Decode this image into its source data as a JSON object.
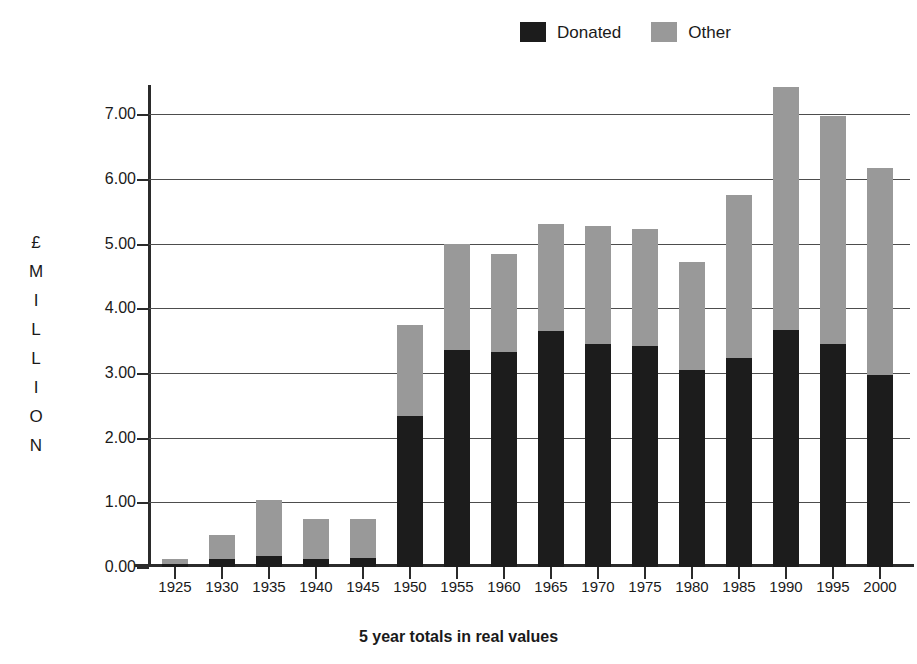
{
  "chart_data": {
    "type": "bar",
    "stacked": true,
    "title": "",
    "xlabel": "5 year totals in real values",
    "ylabel": "£ MILLION",
    "ylabel_letters": [
      "£",
      "M",
      "I",
      "L",
      "L",
      "I",
      "O",
      "N"
    ],
    "categories": [
      "1925",
      "1930",
      "1935",
      "1940",
      "1945",
      "1950",
      "1955",
      "1960",
      "1965",
      "1970",
      "1975",
      "1980",
      "1985",
      "1990",
      "1995",
      "2000"
    ],
    "series": [
      {
        "name": "Donated",
        "color": "#1c1c1c",
        "values": [
          0.05,
          0.12,
          0.17,
          0.12,
          0.14,
          2.33,
          3.35,
          3.33,
          3.65,
          3.44,
          3.41,
          3.05,
          3.23,
          3.67,
          3.45,
          2.97
        ]
      },
      {
        "name": "Other",
        "color": "#999999",
        "values": [
          0.08,
          0.38,
          0.87,
          0.63,
          0.61,
          1.41,
          1.64,
          1.51,
          1.65,
          1.83,
          1.82,
          1.67,
          2.52,
          3.75,
          3.52,
          3.2
        ]
      }
    ],
    "totals": [
      0.13,
      0.5,
      1.04,
      0.75,
      0.75,
      3.74,
      4.99,
      4.84,
      5.3,
      5.27,
      5.23,
      4.72,
      5.75,
      7.42,
      6.97,
      6.17
    ],
    "ylim": [
      0.0,
      7.0
    ],
    "yticks": [
      "0.00",
      "1.00",
      "2.00",
      "3.00",
      "4.00",
      "5.00",
      "6.00",
      "7.00"
    ],
    "ytick_values": [
      0,
      1,
      2,
      3,
      4,
      5,
      6,
      7
    ],
    "grid": true,
    "legend_position": "top-right"
  },
  "legend": {
    "entries": [
      {
        "label": "Donated",
        "color": "#1c1c1c"
      },
      {
        "label": "Other",
        "color": "#999999"
      }
    ]
  }
}
